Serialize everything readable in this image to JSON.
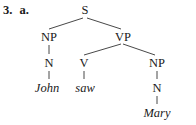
{
  "example": {
    "number": "3.",
    "letter": "a."
  },
  "tree": {
    "root": "S",
    "np_subject": "NP",
    "n_subject": "N",
    "subject_word": "John",
    "vp": "VP",
    "v": "V",
    "verb_word": "saw",
    "np_object": "NP",
    "n_object": "N",
    "object_word": "Mary"
  },
  "colors": {
    "ink": "#1a1a1a",
    "background": "#ffffff"
  }
}
